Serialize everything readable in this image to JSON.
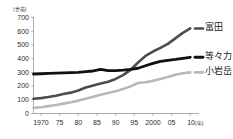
{
  "chart_data": {
    "type": "line",
    "title": "",
    "xlabel": "年",
    "ylabel": "世帯",
    "unit_label": "(世帯)",
    "year_suffix": "(年)",
    "grid": false,
    "legend_position": "right-inline",
    "xlim": [
      1968,
      2011
    ],
    "ylim": [
      0,
      700
    ],
    "ytick_labels": [
      "700",
      "600",
      "500",
      "400",
      "300",
      "200",
      "100",
      "0"
    ],
    "ytick_values": [
      700,
      600,
      500,
      400,
      300,
      200,
      100,
      0
    ],
    "xtick_labels": [
      "1970",
      "75",
      "80",
      "85",
      "90",
      "95",
      "2000",
      "05",
      "10"
    ],
    "xtick_values": [
      1970,
      1975,
      1980,
      1985,
      1990,
      1995,
      2000,
      2005,
      2010
    ],
    "x": [
      1968,
      1970,
      1972,
      1974,
      1976,
      1978,
      1980,
      1982,
      1984,
      1986,
      1988,
      1990,
      1992,
      1994,
      1996,
      1998,
      2000,
      2002,
      2004,
      2006,
      2008,
      2010
    ],
    "series": [
      {
        "name": "富田",
        "color": "#4d4d4d",
        "width": 2.6,
        "values": [
          108,
          112,
          120,
          130,
          142,
          152,
          168,
          190,
          205,
          218,
          232,
          252,
          280,
          318,
          372,
          420,
          452,
          478,
          508,
          548,
          588,
          620
        ]
      },
      {
        "name": "等々力",
        "color": "#111111",
        "width": 2.8,
        "values": [
          288,
          290,
          292,
          294,
          296,
          298,
          300,
          305,
          310,
          322,
          312,
          312,
          316,
          322,
          330,
          348,
          366,
          380,
          388,
          394,
          402,
          410
        ]
      },
      {
        "name": "小岩岳",
        "color": "#b8b8b8",
        "width": 2.6,
        "values": [
          42,
          46,
          54,
          62,
          72,
          82,
          94,
          108,
          122,
          136,
          150,
          162,
          178,
          198,
          222,
          228,
          238,
          252,
          266,
          282,
          294,
          300
        ]
      }
    ],
    "legend_entries": [
      {
        "label": "富田",
        "color": "#4d4d4d"
      },
      {
        "label": "等々力",
        "color": "#111111"
      },
      {
        "label": "小岩岳",
        "color": "#b8b8b8"
      }
    ]
  },
  "axis": {
    "axis_color": "#9a9a9a",
    "tick_color": "#9a9a9a"
  }
}
